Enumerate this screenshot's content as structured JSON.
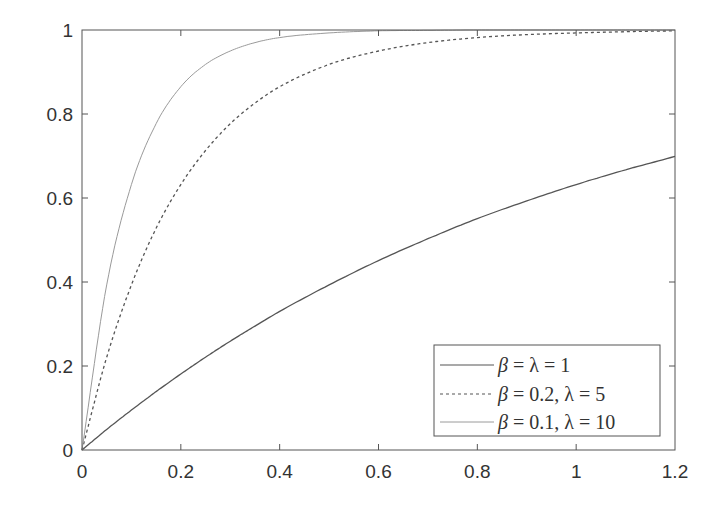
{
  "chart_data": {
    "type": "line",
    "title": "",
    "xlabel": "",
    "ylabel": "",
    "xlim": [
      0,
      1.2
    ],
    "ylim": [
      0,
      1
    ],
    "grid": false,
    "legend_position": "lower right",
    "x_ticks": [
      0,
      0.2,
      0.4,
      0.6,
      0.8,
      1,
      1.2
    ],
    "x_tick_labels": [
      "0",
      "0.2",
      "0.4",
      "0.6",
      "0.8",
      "1",
      "1.2"
    ],
    "y_ticks": [
      0,
      0.2,
      0.4,
      0.6,
      0.8,
      1
    ],
    "y_tick_labels": [
      "0",
      "0.2",
      "0.4",
      "0.6",
      "0.8",
      "1"
    ],
    "x": [
      0,
      0.05,
      0.1,
      0.15,
      0.2,
      0.25,
      0.3,
      0.35,
      0.4,
      0.5,
      0.6,
      0.7,
      0.8,
      0.9,
      1.0,
      1.1,
      1.2
    ],
    "series": [
      {
        "name": "β = λ = 1",
        "style": "solid",
        "color": "#555555",
        "values": [
          0,
          0.049,
          0.095,
          0.139,
          0.181,
          0.221,
          0.259,
          0.295,
          0.33,
          0.393,
          0.451,
          0.503,
          0.551,
          0.593,
          0.632,
          0.667,
          0.699
        ]
      },
      {
        "name": "β = 0.2, λ = 5",
        "style": "dashed",
        "color": "#555555",
        "values": [
          0,
          0.221,
          0.393,
          0.528,
          0.632,
          0.713,
          0.777,
          0.826,
          0.865,
          0.918,
          0.95,
          0.97,
          0.982,
          0.989,
          0.993,
          0.996,
          0.998
        ]
      },
      {
        "name": "β = 0.1, λ = 10",
        "style": "solid-light",
        "color": "#9a9a9a",
        "values": [
          0,
          0.393,
          0.632,
          0.777,
          0.865,
          0.918,
          0.95,
          0.97,
          0.982,
          0.993,
          0.998,
          0.999,
          1.0,
          1.0,
          1.0,
          1.0,
          1.0
        ]
      }
    ]
  },
  "legend": {
    "entries": [
      {
        "label_beta": "β",
        "label_rest": " = λ = 1"
      },
      {
        "label_beta": "β",
        "label_rest": " = 0.2, λ = 5"
      },
      {
        "label_beta": "β",
        "label_rest": " = 0.1, λ = 10"
      }
    ]
  }
}
